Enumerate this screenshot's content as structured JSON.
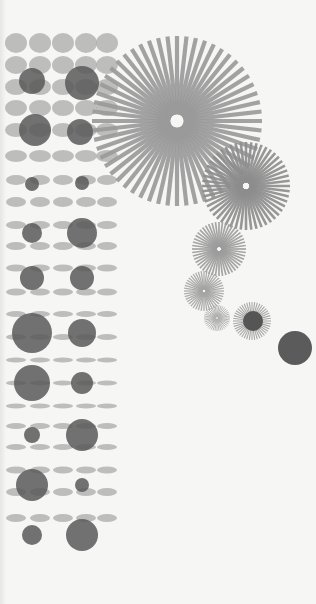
{
  "artwork": {
    "background": "#f6f6f4",
    "grid": {
      "color": "#a9a9a9",
      "opacity": 0.75,
      "columns_x": [
        16,
        40,
        63,
        86,
        107
      ],
      "rows": [
        {
          "y": 43,
          "rx": 11,
          "ry": 10
        },
        {
          "y": 65,
          "rx": 11,
          "ry": 9
        },
        {
          "y": 87,
          "rx": 11,
          "ry": 8
        },
        {
          "y": 108,
          "rx": 11,
          "ry": 8
        },
        {
          "y": 130,
          "rx": 11,
          "ry": 7
        },
        {
          "y": 156,
          "rx": 11,
          "ry": 6
        },
        {
          "y": 180,
          "rx": 10,
          "ry": 5
        },
        {
          "y": 202,
          "rx": 10,
          "ry": 5
        },
        {
          "y": 225,
          "rx": 10,
          "ry": 4
        },
        {
          "y": 246,
          "rx": 10,
          "ry": 4
        },
        {
          "y": 268,
          "rx": 10,
          "ry": 3.5
        },
        {
          "y": 292,
          "rx": 10,
          "ry": 3.5
        },
        {
          "y": 314,
          "rx": 10,
          "ry": 3
        },
        {
          "y": 337,
          "rx": 10,
          "ry": 3
        },
        {
          "y": 360,
          "rx": 10,
          "ry": 2.5
        },
        {
          "y": 383,
          "rx": 10,
          "ry": 2.5
        },
        {
          "y": 406,
          "rx": 10,
          "ry": 2.5
        },
        {
          "y": 426,
          "rx": 10,
          "ry": 3
        },
        {
          "y": 447,
          "rx": 10,
          "ry": 3
        },
        {
          "y": 470,
          "rx": 10,
          "ry": 3.5
        },
        {
          "y": 492,
          "rx": 10,
          "ry": 4
        },
        {
          "y": 518,
          "rx": 10,
          "ry": 4
        }
      ]
    },
    "big_dots": {
      "color": "#595959",
      "opacity": 0.85,
      "items": [
        {
          "cx": 32,
          "cy": 81,
          "r": 13
        },
        {
          "cx": 82,
          "cy": 83,
          "r": 17
        },
        {
          "cx": 35,
          "cy": 130,
          "r": 16
        },
        {
          "cx": 80,
          "cy": 132,
          "r": 13
        },
        {
          "cx": 32,
          "cy": 184,
          "r": 7
        },
        {
          "cx": 82,
          "cy": 183,
          "r": 7
        },
        {
          "cx": 32,
          "cy": 233,
          "r": 10
        },
        {
          "cx": 82,
          "cy": 233,
          "r": 15
        },
        {
          "cx": 32,
          "cy": 278,
          "r": 12
        },
        {
          "cx": 82,
          "cy": 278,
          "r": 12
        },
        {
          "cx": 32,
          "cy": 333,
          "r": 20
        },
        {
          "cx": 82,
          "cy": 333,
          "r": 14
        },
        {
          "cx": 32,
          "cy": 383,
          "r": 18
        },
        {
          "cx": 82,
          "cy": 383,
          "r": 11
        },
        {
          "cx": 32,
          "cy": 435,
          "r": 8
        },
        {
          "cx": 82,
          "cy": 435,
          "r": 16
        },
        {
          "cx": 32,
          "cy": 485,
          "r": 16
        },
        {
          "cx": 82,
          "cy": 485,
          "r": 7
        },
        {
          "cx": 32,
          "cy": 535,
          "r": 10
        },
        {
          "cx": 82,
          "cy": 535,
          "r": 16
        }
      ]
    },
    "starbursts": [
      {
        "cx": 177,
        "cy": 121,
        "r": 85,
        "rays": 56,
        "width": 4.2,
        "color": "#9a9a9a"
      },
      {
        "cx": 246,
        "cy": 186,
        "r": 44,
        "rays": 52,
        "width": 2.6,
        "color": "#8d8d8d"
      },
      {
        "cx": 219,
        "cy": 249,
        "r": 27,
        "rays": 48,
        "width": 1.7,
        "color": "#9c9c9c"
      },
      {
        "cx": 204,
        "cy": 291,
        "r": 20,
        "rays": 44,
        "width": 1.3,
        "color": "#a4a4a4"
      },
      {
        "cx": 217,
        "cy": 318,
        "r": 13,
        "rays": 40,
        "width": 1.0,
        "color": "#b0b0b0"
      },
      {
        "cx": 252,
        "cy": 321,
        "r": 19,
        "rays": 44,
        "width": 1.1,
        "color": "#a0a0a0"
      }
    ],
    "accent_dots": [
      {
        "cx": 253,
        "cy": 321,
        "r": 10,
        "color": "#555555"
      },
      {
        "cx": 295,
        "cy": 348,
        "r": 17,
        "color": "#5b5b5b"
      }
    ]
  }
}
